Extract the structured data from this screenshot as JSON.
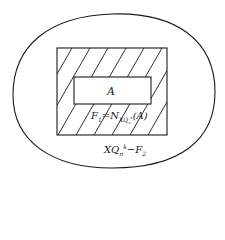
{
  "diagram": {
    "regions": {
      "outer": {
        "label_main": "XQ",
        "label_sub": "n",
        "label_sup": "k",
        "label_tail": "−F",
        "label_tail_sub": "2"
      },
      "inner": {
        "label": "A"
      },
      "band": {
        "label_main": "F",
        "label_sub": "1",
        "label_mid": "=N",
        "label_n_sub": "XQ",
        "label_n_subsub": "n",
        "label_n_sup": "k",
        "label_arg": "(A)"
      }
    },
    "colors": {
      "stroke": "#1a1a1a",
      "background": "#ffffff"
    }
  }
}
